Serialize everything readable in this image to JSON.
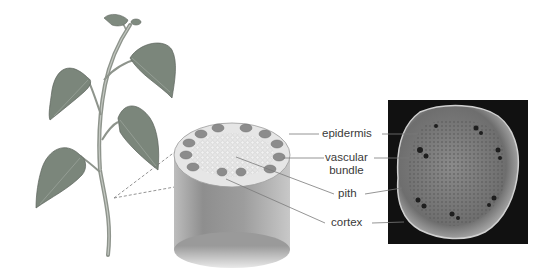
{
  "diagram": {
    "panels": [
      {
        "name": "whole-plant-illustration"
      },
      {
        "name": "stem-section-3d-illustration"
      },
      {
        "name": "stem-cross-section-micrograph"
      }
    ],
    "labels": {
      "epidermis": "epidermis",
      "vascular_line1": "vascular",
      "vascular_line2": "bundle",
      "pith": "pith",
      "cortex": "cortex"
    },
    "colors": {
      "leaf": "#7f8a7f",
      "stem": "#9a9f98",
      "cylinder": "#9c9c9c",
      "bundle": "#8a8a8a",
      "micrograph_bg": "#111111",
      "label_text": "#3a3a3a",
      "leader_line": "#7a7a7a"
    }
  }
}
